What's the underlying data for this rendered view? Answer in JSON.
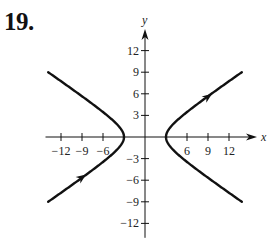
{
  "problem": {
    "number": "19."
  },
  "chart_data": {
    "type": "line",
    "title": "",
    "xlabel": "x",
    "ylabel": "y",
    "xlim": [
      -14.5,
      16
    ],
    "ylim": [
      -14,
      15
    ],
    "grid": false,
    "x_ticks": [
      -12,
      -9,
      -6,
      6,
      9,
      12
    ],
    "x_tick_labels": [
      "−12",
      "−9",
      "−6",
      "6",
      "9",
      "12"
    ],
    "y_ticks": [
      12,
      9,
      6,
      3,
      -3,
      -6,
      -9,
      -12
    ],
    "y_tick_labels": [
      "12",
      "9",
      "6",
      "3",
      "−3",
      "−6",
      "−9",
      "−12"
    ],
    "series": [
      {
        "name": "left branch",
        "equation": "x = -3*sqrt(1 + y^2/4)",
        "y_range": [
          -9,
          9
        ],
        "arrow": {
          "at": [
            -9,
            -5.6
          ],
          "direction": "up-right"
        }
      },
      {
        "name": "right branch",
        "equation": "x = 3*sqrt(1 + y^2/4)",
        "y_range": [
          -9,
          9
        ],
        "arrow": {
          "at": [
            9,
            5.6
          ],
          "direction": "up-right"
        }
      }
    ],
    "vertices": [
      [
        -3,
        0
      ],
      [
        3,
        0
      ]
    ]
  },
  "plot": {
    "origin_px": [
      145,
      137
    ],
    "px_per_unit_x": 7.0,
    "px_per_unit_y": 7.2,
    "stroke_color": "#111111"
  }
}
